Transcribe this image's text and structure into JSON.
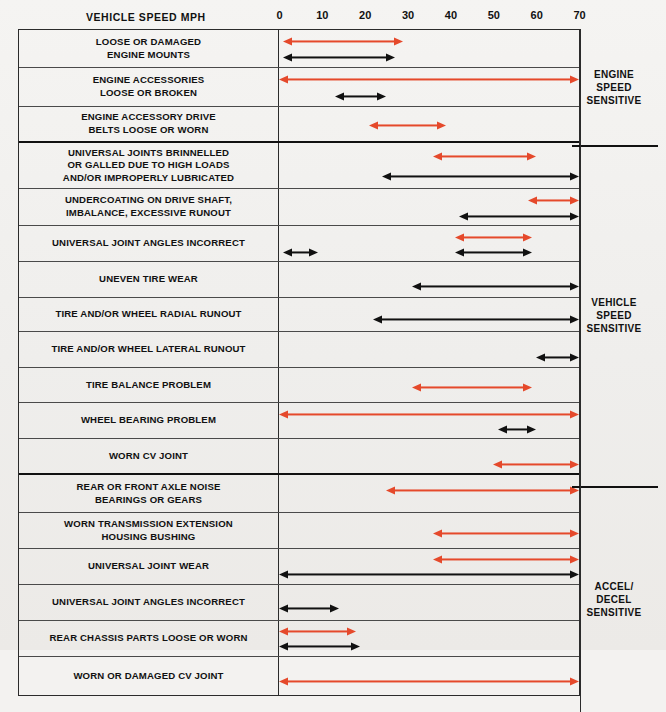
{
  "axis": {
    "title": "VEHICLE SPEED MPH",
    "ticks": [
      "0",
      "10",
      "20",
      "30",
      "40",
      "50",
      "60",
      "70"
    ],
    "min": 0,
    "max": 70
  },
  "colors": {
    "red": "#e5492b",
    "black": "#111111",
    "rule": "#2b2b2b"
  },
  "categories": [
    {
      "name": "engine-speed-sensitive",
      "lines": [
        "ENGINE",
        "SPEED",
        "SENSITIVE"
      ]
    },
    {
      "name": "vehicle-speed-sensitive",
      "lines": [
        "VEHICLE",
        "SPEED",
        "SENSITIVE"
      ]
    },
    {
      "name": "accel-decel-sensitive",
      "lines": [
        "ACCEL/",
        "DECEL",
        "SENSITIVE"
      ]
    }
  ],
  "chart_data": {
    "type": "bar",
    "title": "VEHICLE SPEED MPH",
    "xlabel": "VEHICLE SPEED MPH",
    "ylabel": "",
    "xlim": [
      0,
      70
    ],
    "grid": false,
    "legend": [
      "red = primary range",
      "black = secondary range"
    ],
    "categories": [
      "LOOSE OR DAMAGED ENGINE MOUNTS",
      "ENGINE ACCESSORIES LOOSE OR BROKEN",
      "ENGINE ACCESSORY DRIVE BELTS LOOSE OR WORN",
      "UNIVERSAL JOINTS BRINNELLED OR GALLED DUE TO HIGH LOADS AND/OR IMPROPERLY LUBRICATED",
      "UNDERCOATING ON DRIVE SHAFT, IMBALANCE, EXCESSIVE RUNOUT",
      "UNIVERSAL JOINT ANGLES INCORRECT",
      "UNEVEN TIRE WEAR",
      "TIRE AND/OR WHEEL RADIAL RUNOUT",
      "TIRE AND/OR WHEEL LATERAL RUNOUT",
      "TIRE BALANCE PROBLEM",
      "WHEEL BEARING PROBLEM",
      "WORN CV JOINT",
      "REAR OR FRONT AXLE NOISE BEARINGS OR GEARS",
      "WORN TRANSMISSION EXTENSION HOUSING BUSHING",
      "UNIVERSAL JOINT WEAR",
      "UNIVERSAL JOINT ANGLES INCORRECT",
      "REAR CHASSIS PARTS LOOSE OR WORN",
      "WORN OR DAMAGED CV JOINT"
    ],
    "series": [
      {
        "name": "red",
        "color": "#e5492b",
        "ranges": [
          [
            1,
            29
          ],
          [
            0,
            70
          ],
          [
            21,
            39
          ],
          [
            36,
            60
          ],
          [
            58,
            70
          ],
          [
            41,
            59
          ],
          null,
          null,
          null,
          [
            31,
            59
          ],
          [
            0,
            70
          ],
          [
            50,
            70
          ],
          [
            25,
            70
          ],
          [
            36,
            70
          ],
          [
            36,
            70
          ],
          null,
          [
            0,
            18
          ],
          [
            0,
            70
          ]
        ]
      },
      {
        "name": "black",
        "color": "#111111",
        "ranges": [
          [
            1,
            27
          ],
          [
            13,
            25
          ],
          null,
          [
            24,
            70
          ],
          [
            42,
            70
          ],
          [
            41,
            59
          ],
          [
            31,
            70
          ],
          [
            22,
            70
          ],
          [
            60,
            70
          ],
          null,
          [
            51,
            60
          ],
          null,
          null,
          null,
          [
            0,
            70
          ],
          [
            0,
            14
          ],
          [
            0,
            19
          ],
          null
        ]
      },
      {
        "name": "black2",
        "color": "#111111",
        "ranges": [
          null,
          null,
          null,
          null,
          null,
          [
            1,
            9
          ],
          null,
          null,
          null,
          null,
          null,
          null,
          null,
          null,
          null,
          null,
          null,
          null
        ]
      }
    ]
  },
  "rows": [
    {
      "name": "loose-or-damaged-engine-mounts",
      "label": [
        "LOOSE OR DAMAGED",
        "ENGINE MOUNTS"
      ],
      "height": 38,
      "section_end": false,
      "arrows": [
        {
          "color": "red",
          "from": 1,
          "to": 29,
          "y": 11
        },
        {
          "color": "black",
          "from": 1,
          "to": 27,
          "y": 27
        }
      ]
    },
    {
      "name": "engine-accessories-loose-or-broken",
      "label": [
        "ENGINE ACCESSORIES",
        "LOOSE OR BROKEN"
      ],
      "height": 39,
      "section_end": false,
      "arrows": [
        {
          "color": "red",
          "from": 0,
          "to": 70,
          "y": 11
        },
        {
          "color": "black",
          "from": 13,
          "to": 25,
          "y": 28
        }
      ]
    },
    {
      "name": "engine-accessory-drive-belts",
      "label": [
        "ENGINE ACCESSORY DRIVE",
        "BELTS LOOSE OR WORN"
      ],
      "height": 36,
      "section_end": true,
      "arrows": [
        {
          "color": "red",
          "from": 21,
          "to": 39,
          "y": 18
        }
      ]
    },
    {
      "name": "universal-joints-brinnelled",
      "label": [
        "UNIVERSAL JOINTS BRINNELLED",
        "OR GALLED DUE TO HIGH LOADS",
        "AND/OR IMPROPERLY LUBRICATED"
      ],
      "height": 46,
      "section_end": false,
      "arrows": [
        {
          "color": "red",
          "from": 36,
          "to": 60,
          "y": 13
        },
        {
          "color": "black",
          "from": 24,
          "to": 70,
          "y": 33
        }
      ]
    },
    {
      "name": "undercoating-on-drive-shaft",
      "label": [
        "UNDERCOATING ON DRIVE SHAFT,",
        "IMBALANCE, EXCESSIVE RUNOUT"
      ],
      "height": 37,
      "section_end": false,
      "arrows": [
        {
          "color": "red",
          "from": 58,
          "to": 70,
          "y": 11
        },
        {
          "color": "black",
          "from": 42,
          "to": 70,
          "y": 27
        }
      ]
    },
    {
      "name": "universal-joint-angles-incorrect-vehicle",
      "label": [
        "UNIVERSAL JOINT ANGLES INCORRECT"
      ],
      "height": 36,
      "section_end": false,
      "arrows": [
        {
          "color": "red",
          "from": 41,
          "to": 59,
          "y": 11
        },
        {
          "color": "black",
          "from": 41,
          "to": 59,
          "y": 26
        },
        {
          "color": "black",
          "from": 1,
          "to": 9,
          "y": 26
        }
      ]
    },
    {
      "name": "uneven-tire-wear",
      "label": [
        "UNEVEN TIRE WEAR"
      ],
      "height": 36,
      "section_end": false,
      "arrows": [
        {
          "color": "black",
          "from": 31,
          "to": 70,
          "y": 24
        }
      ]
    },
    {
      "name": "tire-wheel-radial-runout",
      "label": [
        "TIRE AND/OR WHEEL RADIAL RUNOUT"
      ],
      "height": 34,
      "section_end": false,
      "arrows": [
        {
          "color": "black",
          "from": 22,
          "to": 70,
          "y": 21
        }
      ]
    },
    {
      "name": "tire-wheel-lateral-runout",
      "label": [
        "TIRE AND/OR WHEEL LATERAL RUNOUT"
      ],
      "height": 36,
      "section_end": false,
      "arrows": [
        {
          "color": "black",
          "from": 60,
          "to": 70,
          "y": 25
        }
      ]
    },
    {
      "name": "tire-balance-problem",
      "label": [
        "TIRE BALANCE PROBLEM"
      ],
      "height": 35,
      "section_end": false,
      "arrows": [
        {
          "color": "red",
          "from": 31,
          "to": 59,
          "y": 19
        }
      ]
    },
    {
      "name": "wheel-bearing-problem",
      "label": [
        "WHEEL BEARING PROBLEM"
      ],
      "height": 36,
      "section_end": false,
      "arrows": [
        {
          "color": "red",
          "from": 0,
          "to": 70,
          "y": 11
        },
        {
          "color": "black",
          "from": 51,
          "to": 60,
          "y": 26
        }
      ]
    },
    {
      "name": "worn-cv-joint",
      "label": [
        "WORN CV JOINT"
      ],
      "height": 36,
      "section_end": true,
      "arrows": [
        {
          "color": "red",
          "from": 50,
          "to": 70,
          "y": 25
        }
      ]
    },
    {
      "name": "rear-or-front-axle-noise",
      "label": [
        "REAR OR FRONT AXLE NOISE",
        "BEARINGS OR GEARS"
      ],
      "height": 38,
      "section_end": false,
      "arrows": [
        {
          "color": "red",
          "from": 25,
          "to": 70,
          "y": 15
        }
      ]
    },
    {
      "name": "worn-transmission-extension-housing-bushing",
      "label": [
        "WORN TRANSMISSION EXTENSION",
        "HOUSING BUSHING"
      ],
      "height": 36,
      "section_end": false,
      "arrows": [
        {
          "color": "red",
          "from": 36,
          "to": 70,
          "y": 20
        }
      ]
    },
    {
      "name": "universal-joint-wear",
      "label": [
        "UNIVERSAL JOINT WEAR"
      ],
      "height": 36,
      "section_end": false,
      "arrows": [
        {
          "color": "red",
          "from": 36,
          "to": 70,
          "y": 10
        },
        {
          "color": "black",
          "from": 0,
          "to": 70,
          "y": 25
        }
      ]
    },
    {
      "name": "universal-joint-angles-incorrect-accel",
      "label": [
        "UNIVERSAL JOINT ANGLES INCORRECT"
      ],
      "height": 36,
      "section_end": false,
      "arrows": [
        {
          "color": "black",
          "from": 0,
          "to": 14,
          "y": 23
        }
      ]
    },
    {
      "name": "rear-chassis-parts-loose-or-worn",
      "label": [
        "REAR CHASSIS PARTS LOOSE OR WORN"
      ],
      "height": 36,
      "section_end": false,
      "arrows": [
        {
          "color": "red",
          "from": 0,
          "to": 18,
          "y": 10
        },
        {
          "color": "black",
          "from": 0,
          "to": 19,
          "y": 25
        }
      ]
    },
    {
      "name": "worn-or-damaged-cv-joint",
      "label": [
        "WORN OR DAMAGED CV JOINT"
      ],
      "height": 38,
      "section_end": false,
      "arrows": [
        {
          "color": "red",
          "from": 0,
          "to": 70,
          "y": 24
        }
      ]
    }
  ]
}
